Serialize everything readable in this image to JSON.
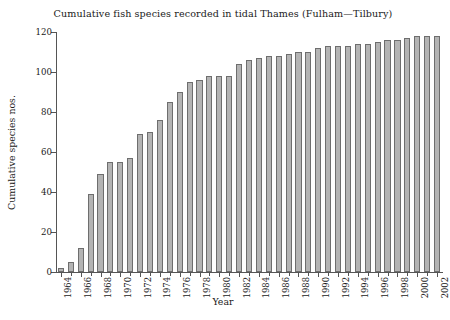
{
  "chart_data": {
    "type": "bar",
    "title": "Cumulative fish species recorded in tidal Thames (Fulham—Tilbury)",
    "xlabel": "Year",
    "ylabel": "Cumulative species nos.",
    "ylim": [
      0,
      120
    ],
    "yticks": [
      0,
      20,
      40,
      60,
      80,
      100,
      120
    ],
    "ytick_labels": [
      "0",
      "20",
      "40",
      "60",
      "80",
      "100",
      "120"
    ],
    "grid": false,
    "legend": null,
    "bar_color": "#b4b4b4",
    "bar_edge_color": "#6e6e6e",
    "axis_color": "#555555",
    "xtick_labels": [
      "1964",
      "1966",
      "1968",
      "1970",
      "1972",
      "1974",
      "1976",
      "1978",
      "1980",
      "1982",
      "1984",
      "1986",
      "1988",
      "1990",
      "1992",
      "1994",
      "1996",
      "1998",
      "2000",
      "2002"
    ],
    "categories": [
      "1964",
      "1965",
      "1966",
      "1967",
      "1968",
      "1969",
      "1970",
      "1971",
      "1972",
      "1973",
      "1974",
      "1975",
      "1976",
      "1977",
      "1978",
      "1979",
      "1980",
      "1981",
      "1982",
      "1983",
      "1984",
      "1985",
      "1986",
      "1987",
      "1988",
      "1989",
      "1990",
      "1991",
      "1992",
      "1993",
      "1994",
      "1995",
      "1996",
      "1997",
      "1998",
      "1999",
      "2000",
      "2001",
      "2002"
    ],
    "values": [
      2,
      5,
      12,
      39,
      49,
      55,
      55,
      57,
      69,
      70,
      76,
      85,
      90,
      95,
      96,
      98,
      98,
      98,
      104,
      106,
      107,
      108,
      108,
      109,
      110,
      110,
      112,
      113,
      113,
      113,
      114,
      114,
      115,
      116,
      116,
      117,
      118,
      118,
      118
    ]
  }
}
